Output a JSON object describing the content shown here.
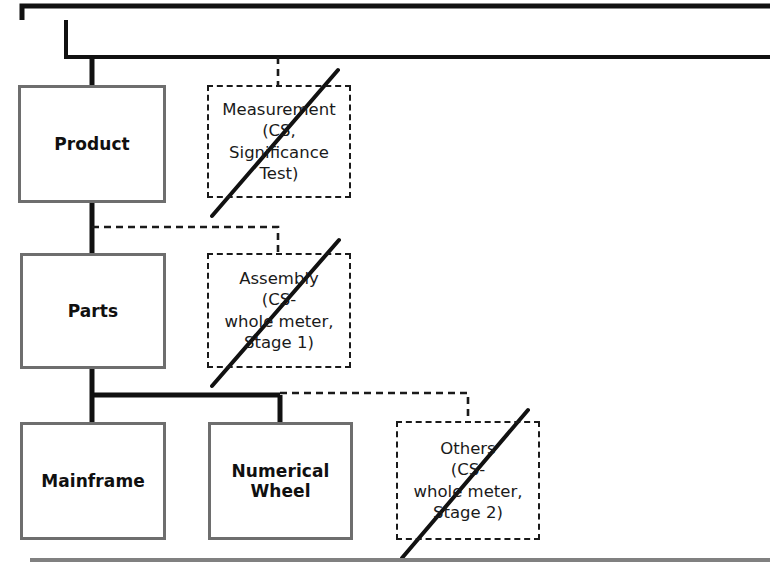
{
  "diagram": {
    "nodes": [
      {
        "id": "product",
        "label": "Product",
        "level": 1,
        "state": "active"
      },
      {
        "id": "parts",
        "label": "Parts",
        "level": 2,
        "state": "active"
      },
      {
        "id": "mainframe",
        "label": "Mainframe",
        "level": 3,
        "state": "active"
      },
      {
        "id": "numerical-wheel",
        "label": "Numerical\nWheel",
        "level": 3,
        "state": "active"
      }
    ],
    "node_labels": {
      "product": "Product",
      "parts": "Parts",
      "mainframe": "Mainframe",
      "numerical_wheel_line1": "Numerical",
      "numerical_wheel_line2": "Wheel"
    },
    "ghost_nodes": [
      {
        "id": "measurement",
        "state": "struck-out",
        "lines": [
          "Measurement",
          "(CS,",
          "Significance",
          "Test)"
        ]
      },
      {
        "id": "assembly",
        "state": "struck-out",
        "lines": [
          "Assembly",
          "(CS-",
          "whole meter,",
          "Stage 1)"
        ]
      },
      {
        "id": "others",
        "state": "struck-out",
        "lines": [
          "Others",
          "(CS-",
          "whole meter,",
          "Stage 2)"
        ]
      }
    ],
    "ghost_labels": {
      "measurement_l1": "Measurement",
      "measurement_l2": "(CS,",
      "measurement_l3": "Significance",
      "measurement_l4": "Test)",
      "assembly_l1": "Assembly",
      "assembly_l2": "(CS-",
      "assembly_l3": "whole meter,",
      "assembly_l4": "Stage 1)",
      "others_l1": "Others",
      "others_l2": "(CS-",
      "others_l3": "whole meter,",
      "others_l4": "Stage 2)"
    },
    "colors": {
      "node_border": "#6e6e6e",
      "node_fill": "#ffffff",
      "ghost_border": "#1a1a1a",
      "connector_solid": "#111111",
      "connector_dashed": "#1a1a1a",
      "strikethrough": "#111111",
      "rule": "#808080",
      "text": "#101010",
      "background": "#ffffff"
    },
    "rules": [
      {
        "id": "top-rule",
        "orientation": "horizontal"
      },
      {
        "id": "bottom-rule",
        "orientation": "horizontal"
      }
    ]
  }
}
